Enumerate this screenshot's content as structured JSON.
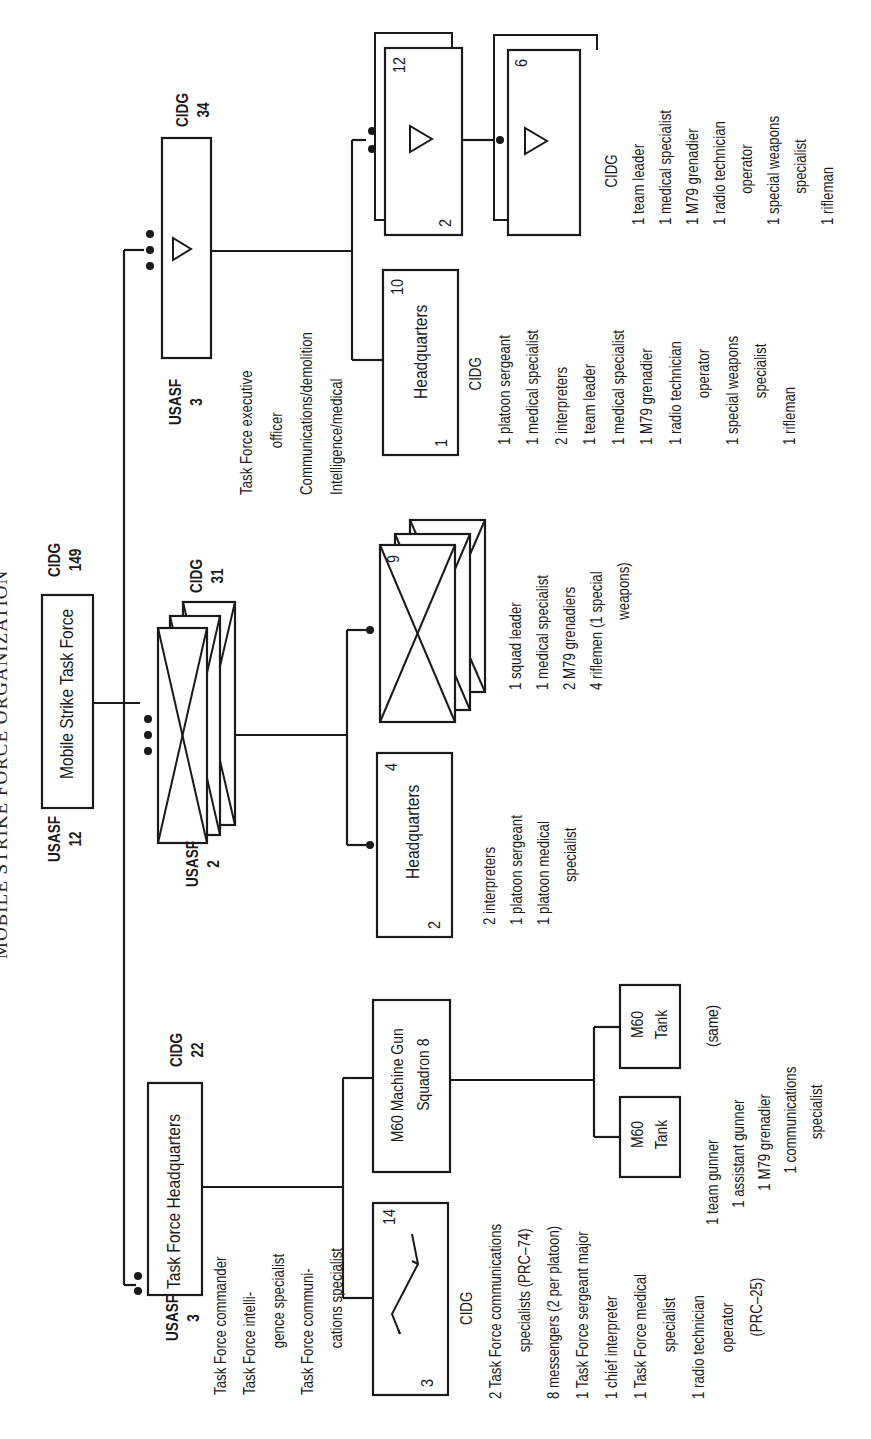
{
  "title": "MOBILE STRIKE FORCE ORGANIZATION",
  "task_force": {
    "label": "Mobile Strike Task Force",
    "usasf_label": "USASF",
    "usasf_count": "12",
    "cidg_label": "CIDG",
    "cidg_count": "149"
  },
  "hq": {
    "label": "Task Force Headquarters",
    "usasf_label": "USASF",
    "usasf_count": "3",
    "cidg_label": "CIDG",
    "cidg_count": "22",
    "usasf_roles": [
      "Task Force commander",
      "Task Force intelli-",
      "gence specialist",
      "Task Force communi-",
      "cations specialist"
    ],
    "commo_section": {
      "left_number": "3",
      "right_number": "14",
      "symbol": "lightning-icon",
      "cidg_header": "CIDG",
      "roles": [
        {
          "text": "2 Task Force communications",
          "indent": false
        },
        {
          "text": "specialists (PRC–74)",
          "indent": true
        },
        {
          "text": "8 messengers (2 per platoon)",
          "indent": false
        },
        {
          "text": "1 Task Force sergeant major",
          "indent": false
        },
        {
          "text": "1 chief interpreter",
          "indent": false
        },
        {
          "text": "1 Task Force medical",
          "indent": false
        },
        {
          "text": "specialist",
          "indent": true
        },
        {
          "text": "1 radio technician",
          "indent": false
        },
        {
          "text": "operator",
          "indent": true
        },
        {
          "text": "(PRC–25)",
          "indent": true
        }
      ]
    },
    "mg_squadron": {
      "line1": "M60 Machine Gun",
      "line2": "Squadron 8",
      "tanks": [
        {
          "line1": "M60",
          "line2": "Tank"
        },
        {
          "line1": "M60",
          "line2": "Tank"
        }
      ],
      "same_note": "(same)",
      "crew": [
        {
          "text": "1 team gunner",
          "indent": false
        },
        {
          "text": "1 assistant gunner",
          "indent": false
        },
        {
          "text": "1 M79 grenadier",
          "indent": false
        },
        {
          "text": "1 communications",
          "indent": false
        },
        {
          "text": "specialist",
          "indent": true
        }
      ]
    }
  },
  "rifle_company": {
    "usasf_label": "USASF",
    "usasf_count": "2",
    "cidg_label": "CIDG",
    "cidg_count": "31",
    "platoon_hq": {
      "label": "Headquarters",
      "left_number": "2",
      "right_number": "4",
      "roles": [
        "2 interpreters",
        "1 platoon sergeant",
        "1 platoon medical",
        "specialist"
      ]
    },
    "squad": {
      "number": "9",
      "roles": [
        "1 squad leader",
        "1 medical specialist",
        "2 M79 grenadiers",
        "4 riflemen (1 special",
        "weapons)"
      ]
    }
  },
  "recon_company": {
    "usasf_label": "USASF",
    "usasf_count": "3",
    "cidg_label": "CIDG",
    "cidg_count": "34",
    "usasf_roles": [
      "Task Force executive",
      "officer",
      "Communications/demolition",
      "Intelligence/medical"
    ],
    "hq": {
      "label": "Headquarters",
      "left_number": "1",
      "right_number": "10",
      "cidg_header": "CIDG",
      "roles": [
        {
          "text": "1 platoon sergeant",
          "indent": false
        },
        {
          "text": "1 medical specialist",
          "indent": false
        },
        {
          "text": "2 interpreters",
          "indent": false
        },
        {
          "text": "1 team leader",
          "indent": false
        },
        {
          "text": "1 medical specialist",
          "indent": false
        },
        {
          "text": "1 M79 grenadier",
          "indent": false
        },
        {
          "text": "1 radio technician",
          "indent": false
        },
        {
          "text": "operator",
          "indent": true
        },
        {
          "text": "1 special weapons",
          "indent": false
        },
        {
          "text": "specialist",
          "indent": true
        },
        {
          "text": "1 rifleman",
          "indent": false
        }
      ]
    },
    "platoon": {
      "left_number": "2",
      "right_number": "12"
    },
    "team": {
      "number": "6",
      "cidg_header": "CIDG",
      "roles": [
        {
          "text": "1 team leader",
          "indent": false
        },
        {
          "text": "1 medical specialist",
          "indent": false
        },
        {
          "text": "1 M79 grenadier",
          "indent": false
        },
        {
          "text": "1 radio technician",
          "indent": false
        },
        {
          "text": "operator",
          "indent": true
        },
        {
          "text": "1 special weapons",
          "indent": false
        },
        {
          "text": "specialist",
          "indent": true
        },
        {
          "text": "1 rifleman",
          "indent": false
        }
      ]
    }
  },
  "colors": {
    "ink": "#1a1a1a",
    "paper": "#ffffff"
  }
}
